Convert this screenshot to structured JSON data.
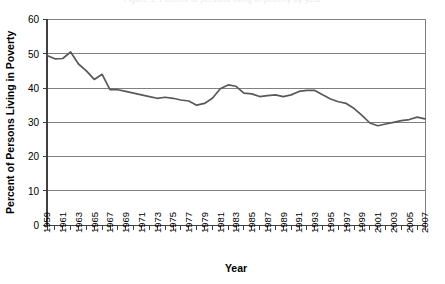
{
  "top_caption": "Figure 1. Percent of persons living in poverty by year",
  "chart_data": {
    "type": "line",
    "title": "",
    "xlabel": "Year",
    "ylabel": "Percent of Persons Living in Poverty",
    "xlim": [
      1959,
      2007
    ],
    "ylim": [
      0,
      60
    ],
    "yticks": [
      0,
      10,
      20,
      30,
      40,
      50,
      60
    ],
    "ytick_labels": [
      "0",
      "10",
      "20",
      "30",
      "40",
      "50",
      "60"
    ],
    "xtick_labels": [
      "1959",
      "1961",
      "1963",
      "1965",
      "1967",
      "1969",
      "1971",
      "1973",
      "1975",
      "1977",
      "1979",
      "1981",
      "1983",
      "1985",
      "1987",
      "1989",
      "1991",
      "1993",
      "1995",
      "1997",
      "1999",
      "2001",
      "2003",
      "2005",
      "2007"
    ],
    "xtick_step": 2,
    "grid": "horizontal",
    "legend": "none",
    "line_color": "#595959",
    "grid_color": "#808080",
    "series": [
      {
        "name": "Percent of Persons Living in Poverty",
        "x": [
          1959,
          1960,
          1961,
          1962,
          1963,
          1964,
          1965,
          1966,
          1967,
          1968,
          1969,
          1970,
          1971,
          1972,
          1973,
          1974,
          1975,
          1976,
          1977,
          1978,
          1979,
          1980,
          1981,
          1982,
          1983,
          1984,
          1985,
          1986,
          1987,
          1988,
          1989,
          1990,
          1991,
          1992,
          1993,
          1994,
          1995,
          1996,
          1997,
          1998,
          1999,
          2000,
          2001,
          2002,
          2003,
          2004,
          2005,
          2006,
          2007
        ],
        "values": [
          49.5,
          48.5,
          48.6,
          50.5,
          47.0,
          45.0,
          42.5,
          44.0,
          39.5,
          39.5,
          39.0,
          38.5,
          38.0,
          37.5,
          37.0,
          37.3,
          37.0,
          36.5,
          36.2,
          35.0,
          35.5,
          37.0,
          39.8,
          40.9,
          40.5,
          38.5,
          38.3,
          37.5,
          37.8,
          38.0,
          37.5,
          38.0,
          39.0,
          39.3,
          39.3,
          38.0,
          36.8,
          36.0,
          35.5,
          34.0,
          32.0,
          29.8,
          29.0,
          29.5,
          30.0,
          30.5,
          30.8,
          31.5,
          31.0
        ]
      }
    ]
  }
}
